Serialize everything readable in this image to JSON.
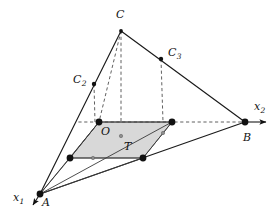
{
  "figure": {
    "type": "geometric-diagram",
    "background_color": "#ffffff",
    "stroke_color": "#1a1a1a",
    "shade_color": "#c9c9c9"
  },
  "labels": {
    "vertex_c": "C",
    "vertex_c2": "C",
    "vertex_c2_sub": "2",
    "vertex_c3": "C",
    "vertex_c3_sub": "3",
    "origin": "O",
    "vertex_a": "A",
    "vertex_b": "B",
    "region_t": "T",
    "axis_x1": "x",
    "axis_x1_sub": "1",
    "axis_x2": "x",
    "axis_x2_sub": "2"
  },
  "points": {
    "C": {
      "x": 121,
      "y": 31,
      "label": "C"
    },
    "C2": {
      "x": 94,
      "y": 84,
      "label": "C2"
    },
    "C3": {
      "x": 161,
      "y": 59,
      "label": "C3"
    },
    "O": {
      "x": 99,
      "y": 122,
      "label": "O"
    },
    "A": {
      "x": 40,
      "y": 194,
      "label": "A"
    },
    "B": {
      "x": 245,
      "y": 122,
      "label": "B"
    },
    "P1": {
      "x": 70,
      "y": 158,
      "label": ""
    },
    "P2": {
      "x": 143,
      "y": 158,
      "label": ""
    },
    "P3": {
      "x": 172,
      "y": 122,
      "label": ""
    }
  },
  "shaded_region": {
    "name": "T",
    "vertices": [
      {
        "x": 99,
        "y": 122
      },
      {
        "x": 172,
        "y": 122
      },
      {
        "x": 143,
        "y": 158
      },
      {
        "x": 70,
        "y": 158
      }
    ]
  },
  "axes": {
    "x1": {
      "from": {
        "x": 40,
        "y": 194
      },
      "to": {
        "x": 31,
        "y": 209
      },
      "arrow": true
    },
    "x2": {
      "from": {
        "x": 245,
        "y": 122
      },
      "to": {
        "x": 271,
        "y": 122
      },
      "arrow": true
    }
  }
}
